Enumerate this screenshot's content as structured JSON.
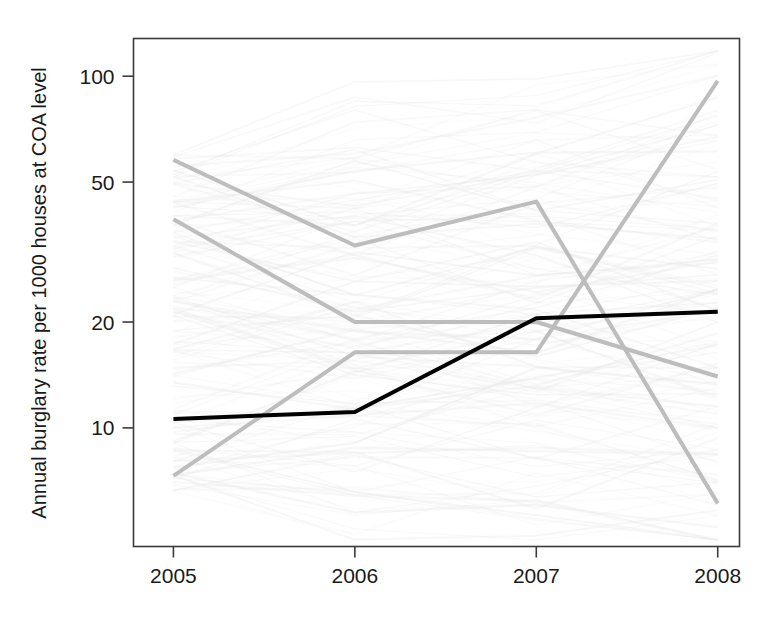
{
  "chart_data": {
    "type": "line",
    "title": "",
    "subtitle": "",
    "xlabel": "",
    "ylabel": "Annual burglary rate per 1000 houses at COA level",
    "x": [
      2005,
      2006,
      2007,
      2008
    ],
    "xtick_labels": [
      "2005",
      "2006",
      "2007",
      "2008"
    ],
    "ytick_labels": [
      "10",
      "20",
      "50",
      "100"
    ],
    "ytick_values": [
      10,
      20,
      50,
      100
    ],
    "yscale": "log",
    "ylim": [
      4.6,
      128
    ],
    "xlim": [
      2004.78,
      2008.12
    ],
    "grid": false,
    "legend": null,
    "legend_position": "none",
    "frame": true,
    "highlight_color": "#000000",
    "emphasis_color": "#b4b4b4",
    "background_trace_color": "#e8e8e8",
    "series": [
      {
        "name": "mean-burglary-rate",
        "role": "highlight",
        "color": "#000000",
        "width": 4.0,
        "opacity": 1,
        "values": [
          10.6,
          11.1,
          20.5,
          21.4
        ]
      },
      {
        "name": "coa-high-declining",
        "role": "emphasis",
        "color": "#bdbdbd",
        "width": 4.0,
        "opacity": 1,
        "values": [
          57.8,
          33.0,
          44.0,
          6.1
        ]
      },
      {
        "name": "coa-mid-declining",
        "role": "emphasis",
        "color": "#bdbdbd",
        "width": 4.0,
        "opacity": 1,
        "values": [
          39.2,
          20.0,
          20.0,
          14.0
        ]
      },
      {
        "name": "coa-low-rising",
        "role": "emphasis",
        "color": "#bdbdbd",
        "width": 4.0,
        "opacity": 1,
        "values": [
          7.3,
          16.4,
          16.4,
          97.0
        ]
      }
    ],
    "background_series_count": 170
  }
}
